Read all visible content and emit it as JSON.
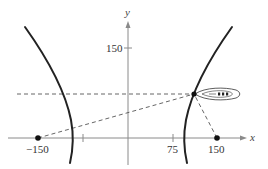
{
  "diagram": {
    "type": "hyperbola-navigation",
    "axes": {
      "x_label": "x",
      "y_label": "y",
      "color": "#8a8a8a"
    },
    "tick_labels": {
      "x_neg150": "−150",
      "x_75": "75",
      "x_150": "150",
      "y_150": "150"
    },
    "foci": [
      {
        "name": "left-station",
        "x": -150,
        "y": 0
      },
      {
        "name": "right-station",
        "x": 150,
        "y": 0
      }
    ],
    "ship": {
      "label": "boat",
      "approx_x": 110,
      "approx_y": 75
    },
    "colors": {
      "curve": "#222222",
      "dashed": "#555555",
      "point": "#111111",
      "axis": "#8a8a8a"
    }
  }
}
